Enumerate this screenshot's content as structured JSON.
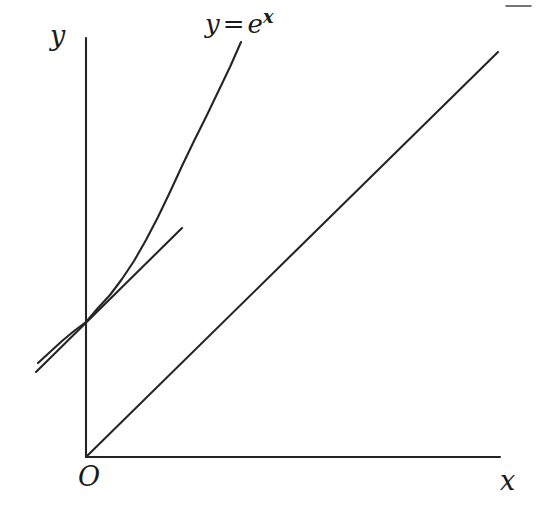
{
  "figure": {
    "background_color": "#ffffff",
    "stroke_color": "#252525",
    "width": 537,
    "height": 514
  },
  "labels": {
    "y_axis": "y",
    "x_axis": "x",
    "origin": "O",
    "curve_lhs": "y",
    "curve_equals": "=",
    "curve_base": "e",
    "curve_exponent": "x"
  },
  "chart_data": {
    "type": "line",
    "title": "",
    "subtitle": "",
    "xlabel": "x",
    "ylabel": "y",
    "origin_label": "O",
    "grid": false,
    "legend": "none",
    "annotations": [
      {
        "name": "curve-equation",
        "text": "y = e^x",
        "x_px": 205,
        "y_px": 8
      }
    ],
    "axes": {
      "x_axis_px": {
        "x1": 86,
        "y1": 457,
        "x2": 500,
        "y2": 457
      },
      "y_axis_px": {
        "x1": 86,
        "y1": 38,
        "x2": 86,
        "y2": 457
      },
      "origin_px": {
        "x": 86,
        "y": 457
      },
      "arrowheads": false,
      "ticks": []
    },
    "series": [
      {
        "name": "y = e^x",
        "kind": "curve",
        "stroke": "#252525",
        "points_px": [
          [
            38,
            363
          ],
          [
            50,
            352
          ],
          [
            62,
            341
          ],
          [
            74,
            331
          ],
          [
            86,
            322
          ],
          [
            98,
            308
          ],
          [
            110,
            295
          ],
          [
            122,
            279
          ],
          [
            134,
            261
          ],
          [
            146,
            240
          ],
          [
            158,
            217
          ],
          [
            170,
            192
          ],
          [
            182,
            166
          ],
          [
            194,
            141
          ],
          [
            206,
            117
          ],
          [
            218,
            92
          ],
          [
            230,
            67
          ],
          [
            241,
            42
          ]
        ]
      },
      {
        "name": "tangent at point of tangency",
        "kind": "line",
        "stroke": "#252525",
        "points_px": [
          [
            36,
            372
          ],
          [
            182,
            228
          ]
        ]
      },
      {
        "name": "y = x",
        "kind": "line",
        "stroke": "#252525",
        "points_px": [
          [
            86,
            457
          ],
          [
            498,
            52
          ]
        ]
      }
    ],
    "artifacts": [
      {
        "name": "top-right-rule-fragment",
        "points_px": [
          [
            506,
            6
          ],
          [
            531,
            6
          ]
        ]
      }
    ]
  }
}
